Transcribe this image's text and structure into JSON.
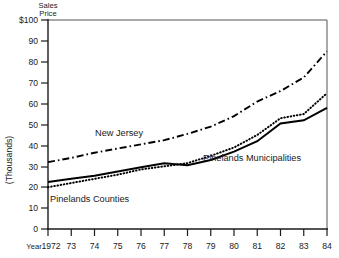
{
  "chart_data": {
    "type": "line",
    "title": "Sales Price",
    "title_line1": "Sales",
    "title_line2": "Price",
    "ylabel": "(Thousands)",
    "xlabel": "Year",
    "x": [
      1972,
      1973,
      1974,
      1975,
      1976,
      1977,
      1978,
      1979,
      1980,
      1981,
      1982,
      1983,
      1984
    ],
    "xtick_labels": [
      "1972",
      "73",
      "74",
      "75",
      "76",
      "77",
      "78",
      "79",
      "80",
      "81",
      "82",
      "83",
      "84"
    ],
    "ytick_labels": [
      "$100",
      "90",
      "80",
      "70",
      "60",
      "50",
      "40",
      "30",
      "20",
      "10",
      "0"
    ],
    "ytick_values": [
      100,
      90,
      80,
      70,
      60,
      50,
      40,
      30,
      20,
      10,
      0
    ],
    "ylim": [
      0,
      100
    ],
    "xlim": [
      1972,
      1984
    ],
    "grid": false,
    "legend": "inline-annotations",
    "series": [
      {
        "name": "New Jersey",
        "style": "dash-dot",
        "values": [
          32,
          34,
          36.5,
          38.5,
          40.5,
          42.5,
          45.5,
          49,
          54,
          61,
          66,
          72.5,
          85
        ]
      },
      {
        "name": "Pinelands Municipalities",
        "style": "dotted",
        "values": [
          20,
          22,
          24,
          26,
          28.5,
          30,
          31.5,
          35,
          39,
          45,
          53,
          55,
          65
        ]
      },
      {
        "name": "Pinelands Counties",
        "style": "solid",
        "values": [
          22.5,
          24,
          25.5,
          27.5,
          29.5,
          31.5,
          30.5,
          33,
          37,
          42,
          50.5,
          52,
          58
        ]
      }
    ],
    "annotations": [
      {
        "text": "New Jersey",
        "x": 1975.0,
        "y": 49.5
      },
      {
        "text": "Pinelands Counties",
        "x": 1972.2,
        "y": 15.5
      },
      {
        "text": "Pinelands Municipalities",
        "x": 1978.9,
        "y": 37.0
      }
    ],
    "colors": {
      "line": "#000000",
      "axis": "#1a1a1a",
      "frame": "#555555",
      "background": "#ffffff"
    }
  }
}
